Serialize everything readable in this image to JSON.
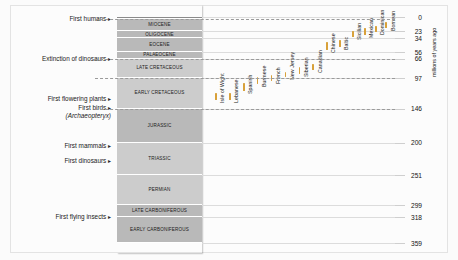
{
  "figure": {
    "axis_title": "millions of years ago"
  },
  "chart_data": {
    "type": "timeline",
    "title": "",
    "ylabel": "millions of years ago",
    "ylim": [
      0,
      359
    ],
    "y_direction": "inverted",
    "grid": true,
    "axis_ticks": [
      0,
      23,
      34,
      56,
      66,
      97,
      146,
      200,
      251,
      299,
      318,
      359
    ],
    "periods": [
      {
        "label": "",
        "top_ma": 0,
        "bottom_ma": 2.6,
        "shade": "dark"
      },
      {
        "label": "MIOCENE",
        "top_ma": 2.6,
        "bottom_ma": 23,
        "shade": "mid"
      },
      {
        "label": "OLIGOCENE",
        "top_ma": 23,
        "bottom_ma": 34,
        "shade": "mid"
      },
      {
        "label": "EOCENE",
        "top_ma": 34,
        "bottom_ma": 56,
        "shade": "mid"
      },
      {
        "label": "PALAEOCENE",
        "top_ma": 56,
        "bottom_ma": 66,
        "shade": "mid"
      },
      {
        "label": "LATE CRETACEOUS",
        "top_ma": 66,
        "bottom_ma": 97,
        "shade": "light"
      },
      {
        "label": "EARLY CRETACEOUS",
        "top_ma": 97,
        "bottom_ma": 146,
        "shade": "light"
      },
      {
        "label": "JURASSIC",
        "top_ma": 146,
        "bottom_ma": 200,
        "shade": "mid"
      },
      {
        "label": "TRIASSIC",
        "top_ma": 200,
        "bottom_ma": 251,
        "shade": "light"
      },
      {
        "label": "PERMIAN",
        "top_ma": 251,
        "bottom_ma": 299,
        "shade": "light"
      },
      {
        "label": "LATE CARBONIFEROUS",
        "top_ma": 299,
        "bottom_ma": 318,
        "shade": "mid"
      },
      {
        "label": "EARLY CARBONIFEROUS",
        "top_ma": 318,
        "bottom_ma": 359,
        "shade": "mid"
      }
    ],
    "events": [
      {
        "label": "First humans",
        "italic": "",
        "ma": 2.6
      },
      {
        "label": "Extinction of dinosaurs",
        "italic": "",
        "ma": 66
      },
      {
        "label": "First flowering plants",
        "italic": "",
        "ma": 130
      },
      {
        "label": "First birds",
        "italic": "(Archaeopteryx)",
        "ma": 150
      },
      {
        "label": "First mammals",
        "italic": "",
        "ma": 205
      },
      {
        "label": "First dinosaurs",
        "italic": "",
        "ma": 228
      },
      {
        "label": "First flying insects",
        "italic": "",
        "ma": 318
      }
    ],
    "amber_deposits": [
      {
        "name": "Isle of Wight",
        "x_pct": 5,
        "top_ma": 120,
        "bottom_ma": 132
      },
      {
        "name": "Lebanese",
        "x_pct": 12.5,
        "top_ma": 120,
        "bottom_ma": 132
      },
      {
        "name": "Spanish",
        "x_pct": 20,
        "top_ma": 105,
        "bottom_ma": 118
      },
      {
        "name": "Burmese",
        "x_pct": 27.5,
        "top_ma": 96,
        "bottom_ma": 106
      },
      {
        "name": "French",
        "x_pct": 35,
        "top_ma": 92,
        "bottom_ma": 102
      },
      {
        "name": "New Jersey",
        "x_pct": 42.5,
        "top_ma": 88,
        "bottom_ma": 96
      },
      {
        "name": "Siberian",
        "x_pct": 50,
        "top_ma": 80,
        "bottom_ma": 90
      },
      {
        "name": "Canadian",
        "x_pct": 57.5,
        "top_ma": 74,
        "bottom_ma": 84
      },
      {
        "name": "Chinese",
        "x_pct": 65,
        "top_ma": 40,
        "bottom_ma": 52
      },
      {
        "name": "Baltic",
        "x_pct": 72,
        "top_ma": 36,
        "bottom_ma": 48
      },
      {
        "name": "Sicilian",
        "x_pct": 79,
        "top_ma": 22,
        "bottom_ma": 32
      },
      {
        "name": "Mexican",
        "x_pct": 85.5,
        "top_ma": 18,
        "bottom_ma": 28
      },
      {
        "name": "Dominican",
        "x_pct": 91.5,
        "top_ma": 14,
        "bottom_ma": 24
      },
      {
        "name": "Bornean",
        "x_pct": 97,
        "top_ma": 8,
        "bottom_ma": 18
      }
    ],
    "colors": {
      "amber": "#d8a13a",
      "period_dark": "#8b8b8b",
      "period_mid": "#b9b9b9",
      "period_light": "#cccccc",
      "grid": "#dcdcdc",
      "background": "#fcfcfc"
    }
  }
}
